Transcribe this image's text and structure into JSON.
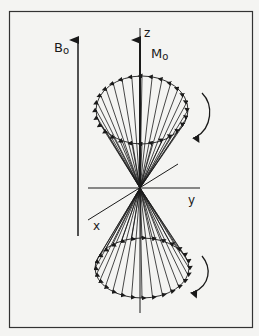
{
  "figure": {
    "labels": {
      "b0": "B",
      "b0_sub": "o",
      "m0": "M",
      "m0_sub": "o",
      "z_axis": "z",
      "y_axis": "y",
      "x_axis": "x"
    },
    "colors": {
      "background": "#f4f4f2",
      "ink": "#1a1a1a",
      "frame": "#333333"
    },
    "cones": [
      {
        "name": "upper-cone",
        "direction": "up",
        "precession": "clockwise-arrow"
      },
      {
        "name": "lower-cone",
        "direction": "down",
        "precession": "clockwise-arrow"
      }
    ]
  }
}
